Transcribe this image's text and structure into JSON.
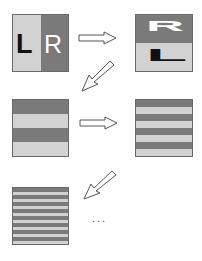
{
  "colors": {
    "dark": "#7a7a7a",
    "light": "#d2d2d2",
    "letter_dark": "#111111",
    "letter_light": "#ffffff",
    "arrow_stroke": "#555555"
  },
  "stage1": {
    "left_letter": "L",
    "right_letter": "R"
  },
  "stage2": {
    "top_letter": "R",
    "bottom_letter": "L",
    "note": "R rotated/stretched on top, L flattened on bottom"
  },
  "stage3": {
    "stripes": 4
  },
  "stage4": {
    "stripes": 8
  },
  "stage5": {
    "stripes": 16
  },
  "ellipsis": "..."
}
